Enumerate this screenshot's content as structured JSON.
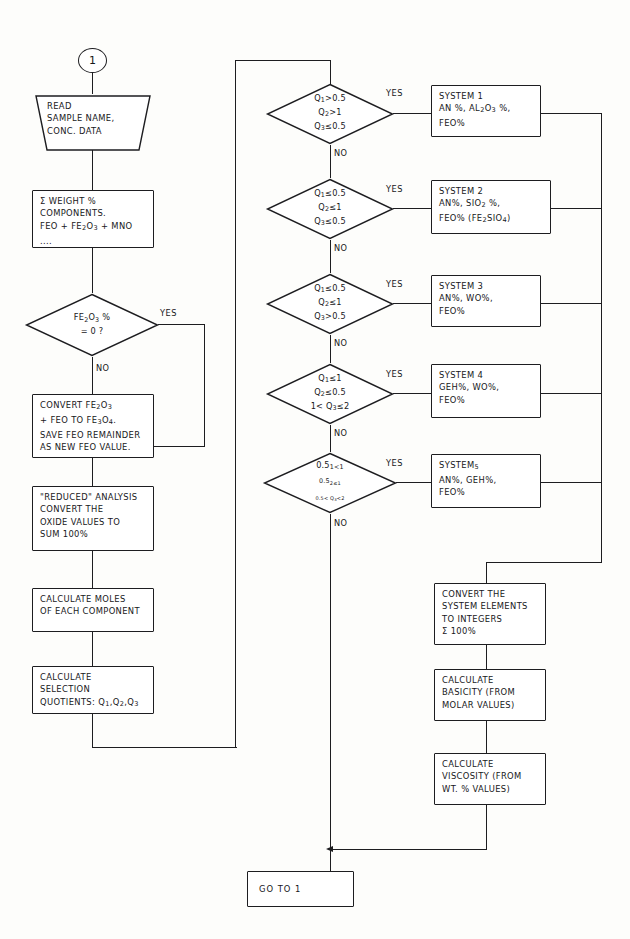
{
  "diagram": {
    "ink_color": "#1d1d20",
    "paper_color": "#fdfdfb"
  },
  "connector": {
    "start_label": "1"
  },
  "left_column": {
    "input": {
      "line1": "READ",
      "line2": "SAMPLE NAME,",
      "line3": "CONC. DATA",
      "text": "READ\nSAMPLE NAME,\nCONC. DATA"
    },
    "sum_weight": {
      "text": "Σ WEIGHT %\nCOMPONENTS.\nFeO + Fe2O3 + MnO ...."
    },
    "decision_fe2o3": {
      "text": "Fe2O3 %\n= 0 ?"
    },
    "convert_fe3o4": {
      "text": "CONVERT Fe2O3\n+ FeO TO Fe3O4.\nSAVE FeO REMAINDER\nAS NEW FeO VALUE."
    },
    "reduced_analysis": {
      "text": "\"REDUCED\" ANALYSIS\nCONVERT THE\nOXIDE VALUES TO\nSUM 100%"
    },
    "calculate_moles": {
      "text": "CALCULATE MOLES\nOF EACH COMPONENT"
    },
    "calculate_quotients": {
      "text": "CALCULATE\nSELECTION\nQUOTIENTS: Q1,Q2,Q3"
    }
  },
  "decisions": [
    {
      "id": "d1",
      "text": "Q1>0.5\nQ2>1\nQ3≤0.5",
      "yes_label": "YES",
      "no_label": "NO"
    },
    {
      "id": "d2",
      "text": "Q1≤0.5\nQ2≤1\nQ3≤0.5",
      "yes_label": "YES",
      "no_label": "NO"
    },
    {
      "id": "d3",
      "text": "Q1≤0.5\nQ2≤1\nQ3>0.5",
      "yes_label": "YES",
      "no_label": "NO"
    },
    {
      "id": "d4",
      "text": "Q1≤1\nQ2≤0.5\n1< Q3≤2",
      "yes_label": "YES",
      "no_label": "NO"
    },
    {
      "id": "d5",
      "text": "0.5<Q1<1\n0.5<Q2≤1\n0.5< Q3<2",
      "yes_label": "YES",
      "no_label": "NO"
    }
  ],
  "systems": [
    {
      "id": "s1",
      "text": "SYSTEM 1\nAN %, Al2O3 %,\nFeO%"
    },
    {
      "id": "s2",
      "text": "SYSTEM 2\nAN%, SiO2 %,\nFeO%   (Fe2SiO4)"
    },
    {
      "id": "s3",
      "text": "SYSTEM 3\nAN%, WO%,\nFeO%"
    },
    {
      "id": "s4",
      "text": "SYSTEM 4\nGEH%, WO%,\nFeO%"
    },
    {
      "id": "s5",
      "text": "SYSTEM5\nAN%, GEH%,\nFeO%"
    }
  ],
  "right_column": {
    "convert_integers": {
      "text": "CONVERT THE\nSYSTEM ELEMENTS\nTO INTEGERS\nΣ 100%"
    },
    "calculate_basicity": {
      "text": "CALCULATE\nBASICITY (FROM\nMOLAR VALUES)"
    },
    "calculate_viscosity": {
      "text": "CALCULATE\nVISCOSITY (FROM\nWT. % VALUES)"
    }
  },
  "terminator": {
    "text": "GO TO  1"
  }
}
